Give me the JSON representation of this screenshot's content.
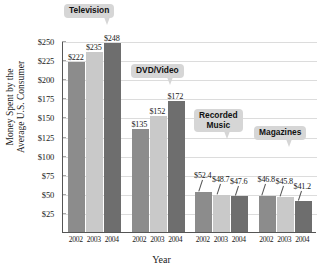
{
  "chart_data": {
    "type": "bar",
    "title": "",
    "xlabel": "Year",
    "ylabel": "Money Spent by the Average U.S. Consumer",
    "ylabel_line1": "Money Spent by the",
    "ylabel_line2": "Average U.S. Consumer",
    "ylim": [
      0,
      260
    ],
    "ytick_labels": [
      "$250",
      "$225",
      "$200",
      "$175",
      "$150",
      "$125",
      "$100",
      "$75",
      "$50",
      "$25"
    ],
    "ytick_values": [
      250,
      225,
      200,
      175,
      150,
      125,
      100,
      75,
      50,
      25
    ],
    "grid": "horizontal",
    "legend": "none",
    "categories": [
      "2002",
      "2003",
      "2004"
    ],
    "groups": [
      {
        "name": "Television",
        "callout_lines": [
          "Television"
        ],
        "values": [
          222,
          235,
          248
        ],
        "labels": [
          "$222",
          "$235",
          "$248"
        ],
        "leader_lines": [
          false,
          false,
          false
        ]
      },
      {
        "name": "DVD/Video",
        "callout_lines": [
          "DVD/Video"
        ],
        "values": [
          135,
          152,
          172
        ],
        "labels": [
          "$135",
          "$152",
          "$172"
        ],
        "leader_lines": [
          false,
          false,
          false
        ]
      },
      {
        "name": "Recorded Music",
        "callout_lines": [
          "Recorded",
          "Music"
        ],
        "values": [
          52.4,
          48.7,
          47.6
        ],
        "labels": [
          "$52.4",
          "$48.7",
          "$47.6"
        ],
        "leader_lines": [
          true,
          true,
          true
        ]
      },
      {
        "name": "Magazines",
        "callout_lines": [
          "Magazines"
        ],
        "values": [
          46.8,
          45.8,
          41.2
        ],
        "labels": [
          "$46.8",
          "$45.8",
          "$41.2"
        ],
        "leader_lines": [
          true,
          true,
          true
        ]
      }
    ],
    "series_colors": {
      "2002": "#8c8c8c",
      "2003": "#c9c9c9",
      "2004": "#6e6e6e"
    },
    "xtick_labels": [
      "2002",
      "2003",
      "2004",
      "2002",
      "2003",
      "2004",
      "2002",
      "2003",
      "2004",
      "2002",
      "2003",
      "2004"
    ]
  }
}
